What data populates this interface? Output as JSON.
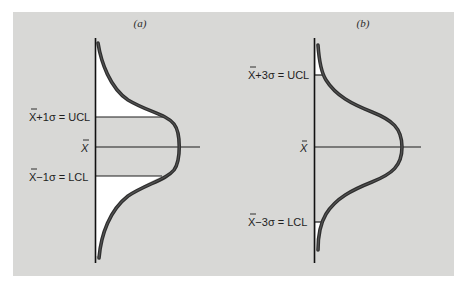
{
  "figure": {
    "background_color": "#d8d8d6",
    "fill_color": "#ffffff",
    "line_color": "#1c1c1c",
    "curve_color": "#3a3a3a",
    "panels": [
      {
        "caption": "(a)",
        "center_label": "X",
        "ucl_label": "X+1σ = UCL",
        "lcl_label": "X−1σ = LCL",
        "sigma_multiple": 1
      },
      {
        "caption": "(b)",
        "center_label": "X",
        "ucl_label": "X+3σ = UCL",
        "lcl_label": "X−3σ = LCL",
        "sigma_multiple": 3
      }
    ]
  }
}
